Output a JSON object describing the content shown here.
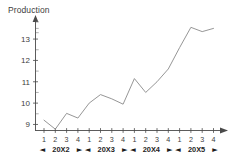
{
  "chart_data": {
    "type": "line",
    "title": "Production",
    "xlabel": "",
    "ylabel": "",
    "ylim": [
      8.6,
      13.8
    ],
    "yticks": [
      9,
      10,
      11,
      12,
      13
    ],
    "ytick_labels": [
      "9",
      "10",
      "11",
      "12",
      "13"
    ],
    "minor_ticks": true,
    "grid": false,
    "legend": false,
    "axis_arrows": true,
    "categories": [
      "20X2 Q1",
      "20X2 Q2",
      "20X2 Q3",
      "20X2 Q4",
      "20X3 Q1",
      "20X3 Q2",
      "20X3 Q3",
      "20X3 Q4",
      "20X4 Q1",
      "20X4 Q2",
      "20X4 Q3",
      "20X4 Q4",
      "20X5 Q1",
      "20X5 Q2",
      "20X5 Q3",
      "20X5 Q4"
    ],
    "quarter_labels": [
      "1",
      "2",
      "3",
      "4",
      "1",
      "2",
      "3",
      "4",
      "1",
      "2",
      "3",
      "4",
      "1",
      "2",
      "3",
      "4"
    ],
    "values": [
      9.2,
      8.78,
      9.52,
      9.3,
      10.0,
      10.4,
      10.2,
      9.95,
      11.15,
      10.5,
      11.0,
      11.6,
      12.6,
      13.55,
      13.35,
      13.5
    ],
    "year_groups": [
      {
        "label": "20X2",
        "left_arrow": "◄",
        "right_arrow": "►",
        "quarters": 4
      },
      {
        "label": "20X3",
        "left_arrow": "◄",
        "right_arrow": "►",
        "quarters": 4
      },
      {
        "label": "20X4",
        "left_arrow": "◄",
        "right_arrow": "►",
        "quarters": 4
      },
      {
        "label": "20X5",
        "left_arrow": "◄",
        "right_arrow": "►",
        "quarters": 4
      }
    ],
    "colors": {
      "line": "#8a8a8a",
      "axis": "#4a4a4a",
      "text": "#3d3d3d",
      "year_text": "#1d1d1d",
      "minor_tick": "#8d8d8d",
      "background": "#ffffff"
    }
  }
}
